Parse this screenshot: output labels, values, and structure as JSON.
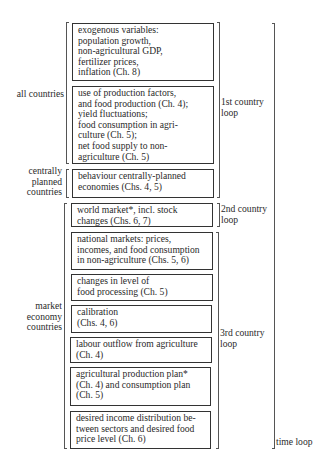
{
  "boxes": [
    {
      "id": "exogenous",
      "text": "exogenous variables:\npopulation growth,\nnon-agricultural GDP,\nfertilizer prices,\ninflation (Ch. 8)"
    },
    {
      "id": "production",
      "text": "use of production factors,\nand food production (Ch. 4);\nyield fluctuations;\nfood consumption in agri-\nculture (Ch. 5);\nnet food supply to non-\nagriculture (Ch. 5)"
    },
    {
      "id": "cpe",
      "text": "behaviour centrally-planned\neconomies (Chs. 4, 5)"
    },
    {
      "id": "world-market",
      "text": "world market*, incl. stock\nchanges (Chs. 6, 7)"
    },
    {
      "id": "national-markets",
      "text": "national markets: prices,\nincomes, and food consumption\nin non-agriculture (Chs. 5, 6)"
    },
    {
      "id": "food-processing",
      "text": "changes in level of\nfood processing (Ch. 5)"
    },
    {
      "id": "calibration",
      "text": "calibration\n(Chs. 4, 6)"
    },
    {
      "id": "labour-outflow",
      "text": "labour outflow from agriculture\n(Ch. 4)"
    },
    {
      "id": "production-plan",
      "text": "agricultural production plan*\n(Ch. 4) and consumption plan\n(Ch. 5)"
    },
    {
      "id": "income-distribution",
      "text": "desired income distribution be-\ntween sectors and desired food\nprice level (Ch. 6)"
    }
  ],
  "left_groups": {
    "all_countries": "all countries",
    "centrally_planned": "centrally\nplanned\ncountries",
    "market_economy": "market\neconomy\ncountries"
  },
  "right_loops": {
    "first": "1st country\nloop",
    "second": "2nd country\nloop",
    "third": "3rd country\nloop",
    "time": "time loop"
  }
}
